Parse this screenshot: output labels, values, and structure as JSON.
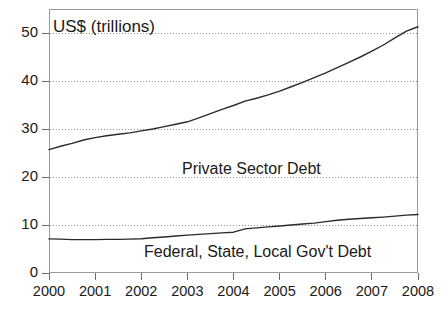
{
  "chart_data": {
    "type": "line",
    "title": "",
    "axis_unit_label": "US$ (trillions)",
    "xlabel": "",
    "ylabel": "",
    "xlim": [
      2000,
      2008
    ],
    "ylim": [
      0,
      55
    ],
    "ytick_labels": [
      "0",
      "10",
      "20",
      "30",
      "40",
      "50"
    ],
    "ytick_values": [
      0,
      10,
      20,
      30,
      40,
      50
    ],
    "xtick_labels": [
      "2000",
      "2001",
      "2002",
      "2003",
      "2004",
      "2005",
      "2006",
      "2007",
      "2008"
    ],
    "xtick_values": [
      2000,
      2001,
      2002,
      2003,
      2004,
      2005,
      2006,
      2007,
      2008
    ],
    "grid": "horizontal-dotted",
    "legend_position": "inline-annotations",
    "line_color": "#2b2b2b",
    "grid_color": "#8d8d8d",
    "frame_color": "#9a9a9a",
    "background_color": "#ffffff",
    "series": [
      {
        "name": "Private Sector Debt",
        "x": [
          2000,
          2000.25,
          2000.5,
          2000.75,
          2001,
          2001.25,
          2001.5,
          2001.75,
          2002,
          2002.25,
          2002.5,
          2002.75,
          2003,
          2003.25,
          2003.5,
          2003.75,
          2004,
          2004.25,
          2004.5,
          2004.75,
          2005,
          2005.25,
          2005.5,
          2005.75,
          2006,
          2006.25,
          2006.5,
          2006.75,
          2007,
          2007.25,
          2007.5,
          2007.75,
          2008
        ],
        "values": [
          25.7,
          26.4,
          27.0,
          27.7,
          28.2,
          28.6,
          28.9,
          29.2,
          29.6,
          30.0,
          30.5,
          31.0,
          31.5,
          32.3,
          33.2,
          34.1,
          34.9,
          35.8,
          36.4,
          37.1,
          37.9,
          38.8,
          39.7,
          40.7,
          41.7,
          42.8,
          43.9,
          45.0,
          46.2,
          47.5,
          49.0,
          50.4,
          51.3
        ]
      },
      {
        "name": "Federal, State, Local Gov't Debt",
        "x": [
          2000,
          2000.25,
          2000.5,
          2000.75,
          2001,
          2001.25,
          2001.5,
          2001.75,
          2002,
          2002.25,
          2002.5,
          2002.75,
          2003,
          2003.25,
          2003.5,
          2003.75,
          2004,
          2004.25,
          2004.5,
          2004.75,
          2005,
          2005.25,
          2005.5,
          2005.75,
          2006,
          2006.25,
          2006.5,
          2006.75,
          2007,
          2007.25,
          2007.5,
          2007.75,
          2008
        ],
        "values": [
          7.1,
          7.05,
          6.95,
          6.95,
          6.95,
          7.0,
          7.0,
          7.05,
          7.15,
          7.35,
          7.5,
          7.7,
          7.9,
          8.05,
          8.2,
          8.35,
          8.5,
          9.2,
          9.4,
          9.6,
          9.8,
          10.0,
          10.2,
          10.4,
          10.7,
          11.0,
          11.2,
          11.35,
          11.5,
          11.65,
          11.85,
          12.05,
          12.2
        ]
      }
    ],
    "annotations": [
      {
        "text": "Private Sector Debt",
        "x": 2003.9,
        "y": 22.5
      },
      {
        "text": "Federal, State, Local Gov't Debt",
        "x": 2003.6,
        "y": 4.0
      },
      {
        "text": "US$ (trillions)",
        "x": 2000.1,
        "y": 52.5
      }
    ]
  }
}
